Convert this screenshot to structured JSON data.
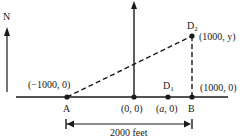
{
  "diagram": {
    "north_label": "N",
    "points": [
      {
        "id": "A",
        "label": "A",
        "coord": "(−1000, 0)"
      },
      {
        "id": "O",
        "label": "",
        "coord": "(0, 0)"
      },
      {
        "id": "D1",
        "label": "D",
        "sub": "1",
        "coord_prefix": "(",
        "coord_var": "a",
        "coord_suffix": ", 0)"
      },
      {
        "id": "B",
        "label": "B",
        "coord": "(1000, 0)"
      },
      {
        "id": "D2",
        "label": "D",
        "sub": "2",
        "coord": "(1000, y)"
      }
    ],
    "distance_label": "2000 feet",
    "colors": {
      "ink": "#1a1a1a",
      "background": "#ffffff"
    }
  }
}
